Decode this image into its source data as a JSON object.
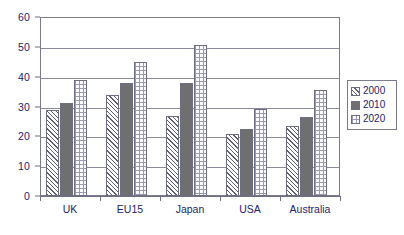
{
  "chart_data": {
    "type": "bar",
    "title": "",
    "subtitle": "",
    "xlabel": "",
    "ylabel": "",
    "ylim": [
      0,
      60
    ],
    "ytick_labels": [
      "0",
      "10",
      "20",
      "30",
      "40",
      "50",
      "60"
    ],
    "ytick_values": [
      0,
      10,
      20,
      30,
      40,
      50,
      60
    ],
    "grid": true,
    "legend_position": "right",
    "categories": [
      "UK",
      "EU15",
      "Japan",
      "USA",
      "Australia"
    ],
    "series": [
      {
        "name": "2000",
        "pattern": "diagonal-hatch",
        "values": [
          28.9,
          33.8,
          26.8,
          20.9,
          23.4
        ]
      },
      {
        "name": "2010",
        "pattern": "solid-gray",
        "values": [
          31.2,
          38.0,
          38.0,
          22.3,
          26.4
        ]
      },
      {
        "name": "2020",
        "pattern": "dotted",
        "values": [
          38.9,
          44.8,
          50.5,
          29.3,
          35.4
        ]
      }
    ]
  },
  "legend": {
    "items": [
      {
        "label": "2000",
        "swatch": "hatch-swatch"
      },
      {
        "label": "2010",
        "swatch": "solid-swatch"
      },
      {
        "label": "2020",
        "swatch": "dotted-swatch"
      }
    ]
  },
  "colors": {
    "series_2000_line": "#5f5f7d",
    "series_2010_fill": "#6f6f6f",
    "series_2020_dots": "#9a9ab6",
    "axis": "#6f6f84",
    "grid": "#8a8a9c",
    "text": "#23236b",
    "background": "#ffffff"
  }
}
